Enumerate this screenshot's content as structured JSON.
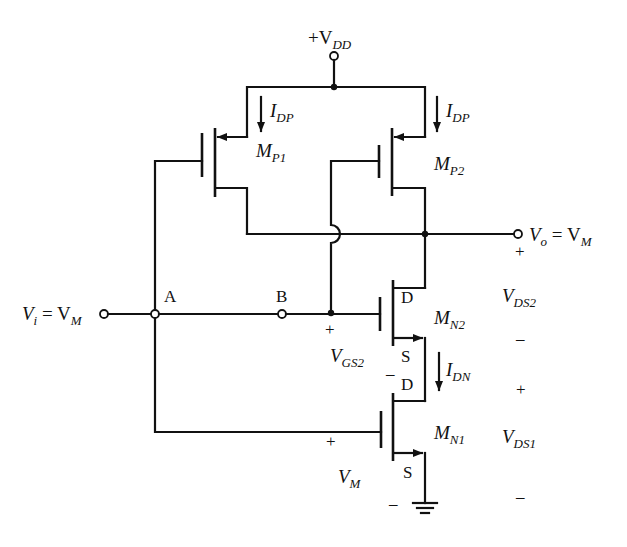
{
  "diagram": {
    "type": "CMOS circuit schematic",
    "supply": {
      "prefix": "+V",
      "sub": "DD"
    },
    "input": {
      "v": "V",
      "v_sub": "i",
      "eq": " = V",
      "m_sub": "M"
    },
    "output": {
      "v": "V",
      "v_sub": "o",
      "eq": " = V",
      "m_sub": "M"
    },
    "nodes": {
      "a": "A",
      "b": "B"
    },
    "transistors": {
      "mp1": {
        "name": "M",
        "sub": "P1"
      },
      "mp2": {
        "name": "M",
        "sub": "P2"
      },
      "mn2": {
        "name": "M",
        "sub": "N2",
        "drain": "D",
        "source": "S"
      },
      "mn1": {
        "name": "M",
        "sub": "N1",
        "drain": "D",
        "source": "S"
      }
    },
    "currents": {
      "idp_left": {
        "name": "I",
        "sub": "DP"
      },
      "idp_right": {
        "name": "I",
        "sub": "DP"
      },
      "idn": {
        "name": "I",
        "sub": "DN"
      }
    },
    "voltages": {
      "vds2": {
        "name": "V",
        "sub": "DS2",
        "plus": "+",
        "minus": "–"
      },
      "vds1": {
        "name": "V",
        "sub": "DS1",
        "plus": "+",
        "minus": "–"
      },
      "vgs2": {
        "name": "V",
        "sub": "GS2",
        "plus": "+",
        "minus": "–"
      },
      "vm": {
        "name": "V",
        "sub": "M",
        "plus": "+",
        "minus": "–"
      }
    }
  }
}
